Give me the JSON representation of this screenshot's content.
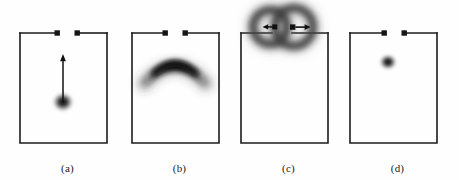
{
  "figure": {
    "type": "scientific-figure",
    "background_color": "#fefefe",
    "ink_color": "#1c1c1c",
    "panel_count": 4
  },
  "panels": [
    {
      "id": "a",
      "caption": "(a)",
      "x": 10,
      "cell": {
        "left": 10,
        "right": 97,
        "top": 33,
        "bottom": 143,
        "gap_left": 47,
        "gap_right": 67
      },
      "terminals": [
        {
          "name": "left-terminal",
          "cx": 47,
          "cy": 33
        },
        {
          "name": "right-terminal",
          "cx": 67,
          "cy": 33
        }
      ],
      "feature": {
        "name": "blob-with-up-arrow",
        "shape": "round-blob",
        "cx": 53,
        "cy": 102,
        "rx": 11,
        "ry": 10,
        "arrow": {
          "direction": "up",
          "from_y": 102,
          "to_y": 57
        }
      }
    },
    {
      "id": "b",
      "caption": "(b)",
      "x": 122,
      "cell": {
        "left": 10,
        "right": 97,
        "top": 33,
        "bottom": 143,
        "gap_left": 43,
        "gap_right": 63
      },
      "terminals": [
        {
          "name": "left-terminal",
          "cx": 43,
          "cy": 33
        },
        {
          "name": "right-terminal",
          "cx": 63,
          "cy": 33
        }
      ],
      "feature": {
        "name": "crescent-arc",
        "shape": "inverted-arc",
        "cx": 53,
        "cy": 70,
        "span": 58,
        "arc_height": 24,
        "thickness": 9,
        "arrow": null
      }
    },
    {
      "id": "c",
      "caption": "(c)",
      "x": 231,
      "cell": {
        "left": 10,
        "right": 97,
        "top": 33,
        "bottom": 143,
        "gap_left": 41,
        "gap_right": 61
      },
      "terminals": [
        {
          "name": "left-ring-terminal",
          "cx": 41,
          "cy": 27
        },
        {
          "name": "right-ring-terminal",
          "cx": 61,
          "cy": 27
        }
      ],
      "feature": {
        "name": "two-overlapping-rings",
        "shape": "vortex-ring-pair",
        "rings": [
          {
            "cx": 39,
            "cy": 27,
            "r": 17,
            "thickness": 7,
            "arrow_direction": "left",
            "arrow_length": 11
          },
          {
            "cx": 63,
            "cy": 27,
            "r": 19,
            "thickness": 7,
            "arrow_direction": "right",
            "arrow_length": 16
          }
        ]
      }
    },
    {
      "id": "d",
      "caption": "(d)",
      "x": 340,
      "cell": {
        "left": 10,
        "right": 97,
        "top": 33,
        "bottom": 143,
        "gap_left": 44,
        "gap_right": 64
      },
      "terminals": [
        {
          "name": "left-terminal",
          "cx": 44,
          "cy": 33
        },
        {
          "name": "right-terminal",
          "cx": 64,
          "cy": 33
        }
      ],
      "feature": {
        "name": "small-blob",
        "shape": "round-blob",
        "cx": 48,
        "cy": 62,
        "rx": 9,
        "ry": 8,
        "arrow": null
      }
    }
  ]
}
